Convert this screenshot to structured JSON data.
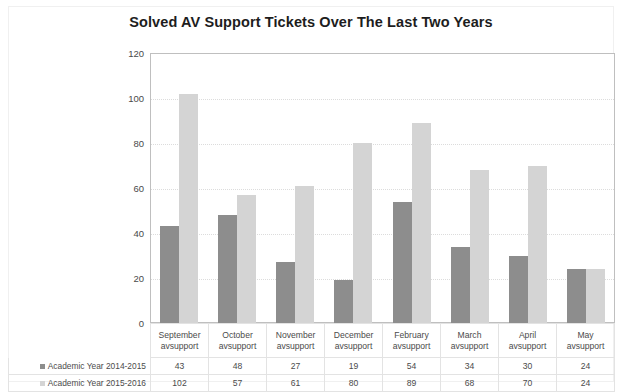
{
  "chart_data": {
    "type": "bar",
    "title": "Solved AV Support Tickets Over The Last Two Years",
    "xlabel": "",
    "ylabel": "",
    "ylim": [
      0,
      120
    ],
    "ytick_step": 20,
    "yticks": [
      120,
      100,
      80,
      60,
      40,
      20,
      0
    ],
    "grid": true,
    "legend_position": "table-left",
    "categories": [
      "September",
      "October",
      "November",
      "December",
      "February",
      "March",
      "April",
      "May"
    ],
    "category_sublabel": "avsupport",
    "series": [
      {
        "name": "Academic Year 2014-2015",
        "color": "#8d8d8d",
        "values": [
          43,
          48,
          27,
          19,
          54,
          34,
          30,
          24
        ]
      },
      {
        "name": "Academic Year 2015-2016",
        "color": "#d4d4d4",
        "values": [
          102,
          57,
          61,
          80,
          89,
          68,
          70,
          24
        ]
      }
    ]
  }
}
